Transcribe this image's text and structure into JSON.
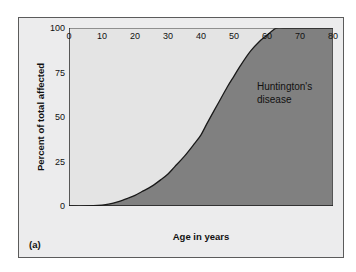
{
  "figure": {
    "panel_label": "(a)",
    "background_color": "#ffffff",
    "panel_color": "#ececed",
    "border_color": "#5b5b5b"
  },
  "annotation": {
    "text": "Huntington's\ndisease",
    "line1": "Huntington's",
    "line2": "disease"
  },
  "chart_data": {
    "type": "area",
    "title": "",
    "subtitle": "",
    "xlabel": "Age in years",
    "ylabel": "Percent of total affected",
    "xlim": [
      0,
      80
    ],
    "ylim": [
      0,
      100
    ],
    "xticks": [
      0,
      10,
      20,
      30,
      40,
      50,
      60,
      70,
      80
    ],
    "yticks": [
      0,
      25,
      50,
      75,
      100
    ],
    "grid": false,
    "legend": "none",
    "annotations": [
      {
        "text": "Huntington's disease",
        "x": 58,
        "y": 72,
        "region": "below-curve"
      }
    ],
    "series": [
      {
        "name": "Huntington's disease",
        "fill_color": "#808080",
        "above_fill_color": "#e4e4e4",
        "line_color": "#1a1a1a",
        "x": [
          0,
          5,
          10,
          12,
          15,
          18,
          20,
          22,
          25,
          28,
          30,
          32,
          35,
          38,
          40,
          42,
          45,
          48,
          50,
          52,
          55,
          58,
          60,
          62,
          63,
          65,
          70,
          75,
          80
        ],
        "values": [
          0,
          0,
          0.5,
          1,
          2.5,
          4.5,
          6,
          8,
          11,
          15,
          18,
          22,
          28,
          35,
          40,
          47,
          57,
          67,
          73,
          79,
          87,
          93,
          96,
          99,
          100,
          100,
          100,
          100,
          100
        ]
      }
    ]
  },
  "axis": {
    "x_tick_labels": [
      "0",
      "10",
      "20",
      "30",
      "40",
      "50",
      "60",
      "70",
      "80"
    ],
    "y_tick_labels": [
      "0",
      "25",
      "50",
      "75",
      "100"
    ]
  }
}
